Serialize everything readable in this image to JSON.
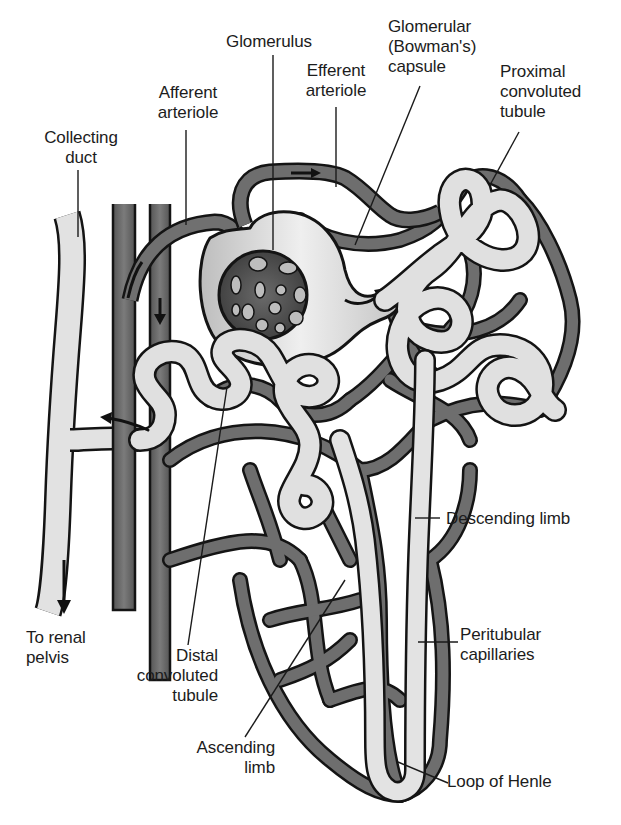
{
  "figure": {
    "colors": {
      "background": "#ffffff",
      "vessel_fill": "#6f6f6f",
      "vessel_dark": "#4a4a4a",
      "tubule_fill": "#d9d9d9",
      "tubule_light": "#ececec",
      "outline": "#141414",
      "label_text": "#1c1c1c"
    }
  },
  "labels": {
    "glomerulus": "Glomerulus",
    "bowmans_capsule": "Glomerular\n(Bowman's)\ncapsule",
    "efferent_arteriole": "Efferent\narteriole",
    "afferent_arteriole": "Afferent\narteriole",
    "proximal_tubule": "Proximal\nconvoluted\ntubule",
    "collecting_duct": "Collecting\nduct",
    "descending_limb": "Descending limb",
    "peritubular_capillaries": "Peritubular\ncapillaries",
    "to_renal_pelvis": "To renal\npelvis",
    "distal_tubule": "Distal\nconvoluted\ntubule",
    "ascending_limb": "Ascending\nlimb",
    "loop_of_henle": "Loop of Henle"
  }
}
